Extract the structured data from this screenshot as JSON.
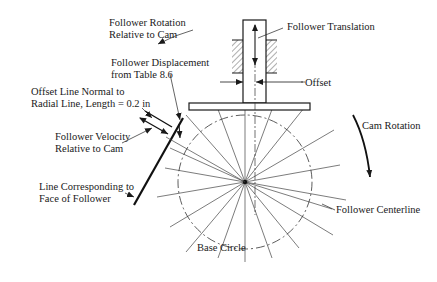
{
  "diagram": {
    "labels": {
      "follower_rotation": [
        "Follower Rotation",
        "Relative to Cam"
      ],
      "follower_translation": "Follower Translation",
      "follower_displacement": [
        "Follower Displacement",
        "from Table 8.6"
      ],
      "offset_line": [
        "Offset Line Normal to",
        "Radial Line, Length = 0.2 in"
      ],
      "offset": "Offset",
      "follower_velocity": [
        "Follower Velocity",
        "Relative to Cam"
      ],
      "cam_rotation": "Cam Rotation",
      "face_line": [
        "Line Corresponding to",
        "Face of Follower"
      ],
      "follower_centerline": "Follower Centerline",
      "base_circle": "Base Circle"
    },
    "colors": {
      "line": "#1a1a1a",
      "thin": "#444444",
      "background": "#ffffff"
    },
    "geometry": {
      "cam_center": [
        245,
        182
      ],
      "base_circle_radius": 67,
      "radial_line_count": 18
    }
  }
}
